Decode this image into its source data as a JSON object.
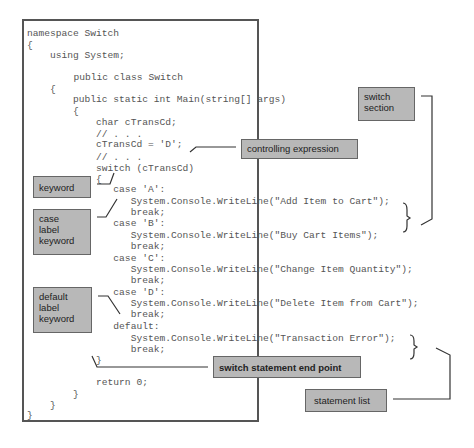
{
  "code_lines": [
    "namespace Switch",
    "{",
    "    using System;",
    "",
    "      public class Switch",
    "    {",
    "        public static int Main(string[] args)",
    "        {",
    "            char cTransCd;",
    "            // . . .",
    "            cTransCd = 'D';",
    "            // . . .",
    "            switch (cTransCd)",
    "            {",
    "               case 'A':",
    "                  System.Console.WriteLine(\"Add Item to Cart\");",
    "                  break;",
    "               case 'B':",
    "                  System.Console.WriteLine(\"Buy Cart Items\");",
    "                  break;",
    "               case 'C':",
    "                  System.Console.WriteLine(\"Change Item Quantity\");",
    "                  break;",
    "               case 'D':",
    "                  System.Console.WriteLine(\"Delete Item from Cart\");",
    "                  break;",
    "               default:",
    "                  System.Console.WriteLine(\"Transaction Error\");",
    "                  break;",
    "            }",
    "",
    "            return 0;",
    "        }",
    "    }",
    "}"
  ],
  "annotations": {
    "switch_section": "switch\nsection",
    "controlling_expression": "controlling expression",
    "keyword": "keyword",
    "case_label_keyword": "case\nlabel\nkeyword",
    "default_label_keyword": "default\nlabel\nkeyword",
    "switch_statement_end_point": "switch statement end point",
    "statement_list": "statement list"
  }
}
